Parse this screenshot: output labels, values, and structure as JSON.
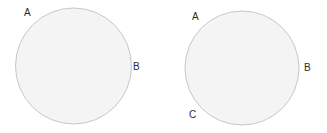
{
  "canvas": {
    "width": 327,
    "height": 133,
    "background_color": "#ffffff"
  },
  "style": {
    "shape_fill_color": "#f4f4f4",
    "shape_stroke_color": "#c8c8c8",
    "shape_stroke_width": 1,
    "label_color": "#2b2b2b",
    "label_font_size": 10
  },
  "figures": [
    {
      "id": "circle-1",
      "shape": "circle",
      "center_x": 73.5,
      "center_y": 66,
      "radius": 58,
      "labels": [
        {
          "text": "A",
          "x": 24,
          "y": 8,
          "position": "upper-left-outside"
        },
        {
          "text": "B",
          "x": 133,
          "y": 62,
          "position": "right-outside"
        }
      ]
    },
    {
      "id": "circle-2",
      "shape": "circle",
      "center_x": 242,
      "center_y": 68,
      "radius": 57,
      "labels": [
        {
          "text": "A",
          "x": 192,
          "y": 12,
          "position": "upper-left-outside"
        },
        {
          "text": "B",
          "x": 304,
          "y": 63,
          "position": "right-outside"
        },
        {
          "text": "C",
          "x": 189,
          "y": 110,
          "position": "lower-left-outside"
        }
      ]
    }
  ]
}
